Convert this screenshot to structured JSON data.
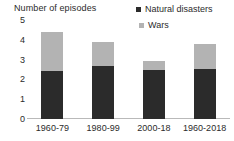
{
  "chart_data": {
    "type": "bar",
    "subtype": "stacked",
    "title": "Number of episodes",
    "xlabel": "",
    "ylabel": "Number of episodes",
    "ylim": [
      0,
      5
    ],
    "yticks": [
      "5",
      "4",
      "3",
      "2",
      "1",
      "0"
    ],
    "ytick_values": [
      5,
      4,
      3,
      2,
      1,
      0
    ],
    "grid": false,
    "legend_position": "top-right",
    "categories": [
      "1960-79",
      "1980-99",
      "2000-18",
      "1960-2018"
    ],
    "series": [
      {
        "name": "Natural disasters",
        "color": "#2b2b2b",
        "values": [
          2.45,
          2.7,
          2.5,
          2.55
        ]
      },
      {
        "name": "Wars",
        "color": "#b3b3b3",
        "values": [
          1.95,
          1.2,
          0.45,
          1.25
        ]
      }
    ],
    "totals": [
      4.4,
      3.9,
      2.95,
      3.8
    ]
  },
  "legend": {
    "items": [
      {
        "label": "Natural disasters",
        "marker": "square-marker",
        "color": "#2b2b2b"
      },
      {
        "label": "Wars",
        "marker": "square-marker",
        "color": "#b3b3b3"
      }
    ]
  },
  "axis": {
    "title": "Number of episodes"
  }
}
